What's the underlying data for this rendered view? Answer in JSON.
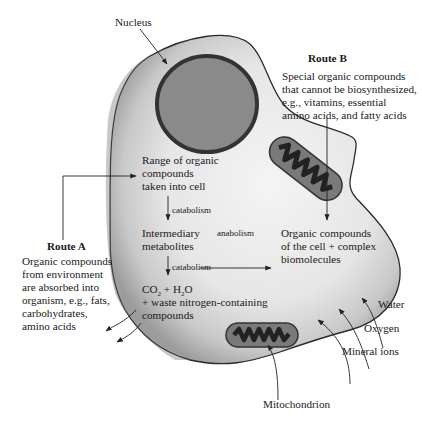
{
  "figure": {
    "type": "cell metabolism diagram",
    "colors": {
      "cell_fill_light": "#f2f2f2",
      "cell_fill_dark": "#9a9a9a",
      "cell_outline": "#2a2a2a",
      "nucleus_fill": "#8a8a8a",
      "nucleus_outline": "#333333",
      "mitochondrion_fill": "#6e6e6e",
      "mitochondrion_cristae": "#2a2a2a",
      "arrow": "#222222"
    }
  },
  "labels": {
    "nucleus": "Nucleus",
    "mitochondrion": "Mitochondrion",
    "water": "Water",
    "oxygen": "Oxygen",
    "mineral_ions": "Mineral ions"
  },
  "route_a": {
    "title": "Route A",
    "lines": [
      "Organic compounds",
      "from environment",
      "are absorbed into",
      "organism, e.g., fats,",
      "carbohydrates,",
      "amino acids"
    ]
  },
  "route_b": {
    "title": "Route B",
    "lines": [
      "Special organic compounds",
      "that cannot be biosynthesized,",
      "e.g., vitamins, essential",
      "amino acids, and fatty acids"
    ]
  },
  "pathway": {
    "intake": [
      "Range of organic",
      "compounds",
      "taken into cell"
    ],
    "step1_label": "catabolism",
    "intermediate": [
      "Intermediary",
      "metabolites"
    ],
    "step2_label": "catabolism",
    "anabolism_label": "anabolism",
    "products_line1_parts": [
      "CO",
      "2",
      " + H",
      "2",
      "O"
    ],
    "products_line2": "+ waste nitrogen-containing",
    "products_line3": "compounds",
    "biosynthesis": [
      "Organic compounds",
      "of the cell + complex",
      "biomolecules"
    ]
  }
}
